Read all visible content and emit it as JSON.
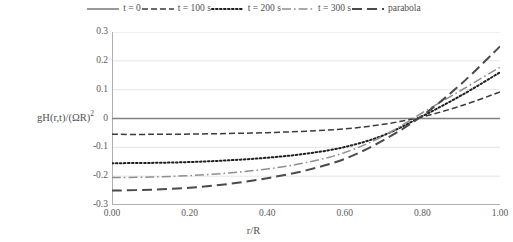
{
  "chart_data": {
    "type": "line",
    "title": "",
    "subtitle": "",
    "xlabel": "r/R",
    "ylabel": "gH(r,t)/(ΩR)²",
    "xlim": [
      0.0,
      1.0
    ],
    "ylim": [
      -0.3,
      0.3
    ],
    "xticks": [
      "0.00",
      "0.20",
      "0.40",
      "0.60",
      "0.80",
      "1.00"
    ],
    "xtick_values": [
      0.0,
      0.2,
      0.4,
      0.6,
      0.8,
      1.0
    ],
    "yticks": [
      "0.3",
      "0.2",
      "0.1",
      "0",
      "-0.1",
      "-0.2",
      "-0.3"
    ],
    "ytick_values": [
      0.3,
      0.2,
      0.1,
      0.0,
      -0.1,
      -0.2,
      -0.3
    ],
    "grid": true,
    "legend_position": "top-center",
    "x": [
      0.0,
      0.1,
      0.2,
      0.3,
      0.4,
      0.5,
      0.6,
      0.7,
      0.8,
      0.9,
      1.0
    ],
    "series": [
      {
        "name": "t = 0",
        "style": "solid",
        "color": "#808080",
        "values": [
          0.0,
          0.0,
          0.0,
          0.0,
          0.0,
          0.0,
          0.0,
          0.0,
          0.0,
          0.0,
          0.0
        ]
      },
      {
        "name": "t = 100 s",
        "style": "dashed",
        "color": "#3b3b3b",
        "values": [
          -0.055,
          -0.055,
          -0.054,
          -0.052,
          -0.049,
          -0.044,
          -0.036,
          -0.02,
          0.006,
          0.044,
          0.092
        ]
      },
      {
        "name": "t = 200 s",
        "style": "dotted",
        "color": "#1f1f1f",
        "values": [
          -0.155,
          -0.154,
          -0.151,
          -0.145,
          -0.136,
          -0.122,
          -0.099,
          -0.058,
          0.008,
          0.08,
          0.16
        ]
      },
      {
        "name": "t = 300 s",
        "style": "dash-dot",
        "color": "#8f8f8f",
        "values": [
          -0.205,
          -0.203,
          -0.198,
          -0.189,
          -0.175,
          -0.153,
          -0.118,
          -0.06,
          0.02,
          0.098,
          0.178
        ]
      },
      {
        "name": "parabola",
        "style": "long-dash",
        "color": "#4a4a4a",
        "values": [
          -0.25,
          -0.247,
          -0.24,
          -0.227,
          -0.207,
          -0.18,
          -0.14,
          -0.075,
          0.01,
          0.12,
          0.25
        ]
      }
    ]
  },
  "legend": {
    "items": [
      {
        "label": "t = 0",
        "swatch": "solid-line-swatch"
      },
      {
        "label": "t = 100 s",
        "swatch": "dashed-line-swatch"
      },
      {
        "label": "t = 200 s",
        "swatch": "dotted-line-swatch"
      },
      {
        "label": "t = 300 s",
        "swatch": "dash-dot-line-swatch"
      },
      {
        "label": "parabola",
        "swatch": "long-dash-line-swatch"
      }
    ]
  },
  "axes": {
    "y_title_main": "gH(r,t)/(ΩR)",
    "y_title_sup": "2",
    "x_title": "r/R"
  }
}
